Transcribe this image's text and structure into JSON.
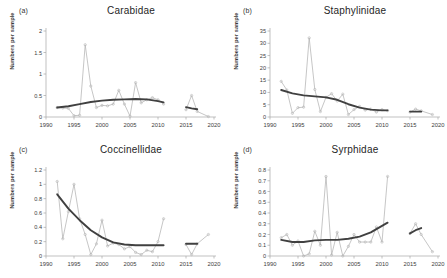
{
  "figure": {
    "background": "#ffffff",
    "series_color": "#b3b3b3",
    "trend_color": "#404040",
    "axis_color": "#a6a6a6",
    "text_color": "#3d3d3d"
  },
  "panels": [
    {
      "letter": "(a)",
      "title": "Carabidae",
      "ylabel": "Numbers per sample"
    },
    {
      "letter": "(b)",
      "title": "Staphylinidae",
      "ylabel": "Numbers per sample"
    },
    {
      "letter": "(c)",
      "title": "Coccinellidae",
      "ylabel": "Numbers per sample"
    },
    {
      "letter": "(d)",
      "title": "Syrphidae",
      "ylabel": "Numbers per sample"
    }
  ],
  "chart_data": [
    {
      "type": "line",
      "panel": "(a)",
      "title": "Carabidae",
      "xlabel": "",
      "ylabel": "Numbers per sample",
      "xlim": [
        1990,
        2020
      ],
      "ylim": [
        0,
        2
      ],
      "xticks": [
        1990,
        1995,
        2000,
        2005,
        2010,
        2015,
        2020
      ],
      "yticks": [
        0,
        0.5,
        1,
        1.5,
        2
      ],
      "grid": false,
      "legend": "none",
      "series": [
        {
          "name": "Numbers per sample (annual means)",
          "color": "#b3b3b3",
          "marker": "open-circle",
          "x": [
            1992,
            1993,
            1994,
            1995,
            1996,
            1997,
            1998,
            1999,
            2000,
            2001,
            2002,
            2003,
            2004,
            2005,
            2006,
            2007,
            2008,
            2009,
            2010,
            2011,
            2015,
            2016,
            2017,
            2019
          ],
          "y": [
            0.22,
            0.21,
            0.2,
            0.03,
            0.04,
            1.68,
            0.72,
            0.22,
            0.27,
            0.26,
            0.3,
            0.62,
            0.3,
            0.02,
            0.8,
            0.33,
            0.4,
            0.45,
            0.4,
            0.3,
            0.17,
            0.5,
            0.13,
            0.01
          ]
        },
        {
          "name": "Smoothed trend",
          "color": "#404040",
          "marker": "none",
          "x": [
            1992,
            1994,
            1996,
            1998,
            2000,
            2002,
            2004,
            2006,
            2008,
            2010,
            2011,
            2015,
            2016,
            2017
          ],
          "y": [
            0.22,
            0.25,
            0.3,
            0.35,
            0.38,
            0.4,
            0.41,
            0.42,
            0.41,
            0.37,
            0.34,
            0.23,
            0.2,
            0.18
          ]
        }
      ]
    },
    {
      "type": "line",
      "panel": "(b)",
      "title": "Staphylinidae",
      "xlabel": "",
      "ylabel": "Numbers per sample",
      "xlim": [
        1990,
        2020
      ],
      "ylim": [
        0,
        35
      ],
      "xticks": [
        1990,
        1995,
        2000,
        2005,
        2010,
        2015,
        2020
      ],
      "yticks": [
        0,
        5,
        10,
        15,
        20,
        25,
        30,
        35
      ],
      "grid": false,
      "legend": "none",
      "series": [
        {
          "name": "Numbers per sample (annual means)",
          "color": "#b3b3b3",
          "marker": "open-circle",
          "x": [
            1992,
            1993,
            1994,
            1995,
            1996,
            1997,
            1998,
            1999,
            2000,
            2001,
            2002,
            2003,
            2004,
            2005,
            2006,
            2007,
            2008,
            2009,
            2010,
            2011,
            2015,
            2016,
            2017,
            2019
          ],
          "y": [
            14.5,
            11.0,
            1.5,
            3.8,
            4.0,
            32.2,
            11.2,
            2.2,
            8.0,
            9.5,
            6.5,
            9.3,
            1.0,
            3.0,
            4.3,
            2.8,
            3.2,
            2.0,
            3.0,
            2.6,
            2.0,
            3.2,
            2.5,
            1.0
          ]
        },
        {
          "name": "Smoothed trend",
          "color": "#404040",
          "marker": "none",
          "x": [
            1992,
            1994,
            1996,
            1998,
            2000,
            2002,
            2004,
            2006,
            2008,
            2010,
            2011,
            2015,
            2016,
            2017
          ],
          "y": [
            11.0,
            9.6,
            8.8,
            8.4,
            8.0,
            7.0,
            5.2,
            3.8,
            3.0,
            2.7,
            2.7,
            2.2,
            2.2,
            2.2
          ]
        }
      ]
    },
    {
      "type": "line",
      "panel": "(c)",
      "title": "Coccinellidae",
      "xlabel": "",
      "ylabel": "Numbers per sample",
      "xlim": [
        1990,
        2020
      ],
      "ylim": [
        0,
        1.2
      ],
      "xticks": [
        1990,
        1995,
        2000,
        2005,
        2010,
        2015,
        2020
      ],
      "yticks": [
        0,
        0.2,
        0.4,
        0.6,
        0.8,
        1,
        1.2
      ],
      "grid": false,
      "legend": "none",
      "series": [
        {
          "name": "Numbers per sample (annual means)",
          "color": "#b3b3b3",
          "marker": "open-circle",
          "x": [
            1992,
            1993,
            1994,
            1995,
            1996,
            1997,
            1998,
            1999,
            2000,
            2001,
            2002,
            2003,
            2004,
            2005,
            2006,
            2007,
            2008,
            2009,
            2010,
            2011,
            2015,
            2016,
            2017,
            2019
          ],
          "y": [
            1.04,
            0.24,
            0.62,
            1.0,
            0.52,
            0.3,
            0.02,
            0.17,
            0.5,
            0.14,
            0.18,
            0.16,
            0.1,
            0.13,
            0.05,
            0.02,
            0.08,
            0.06,
            0.2,
            0.52,
            0.16,
            0.02,
            0.17,
            0.3
          ]
        },
        {
          "name": "Smoothed trend",
          "color": "#404040",
          "marker": "none",
          "x": [
            1992,
            1994,
            1996,
            1998,
            2000,
            2002,
            2004,
            2006,
            2008,
            2010,
            2011,
            2015,
            2016,
            2017
          ],
          "y": [
            0.86,
            0.66,
            0.5,
            0.36,
            0.26,
            0.19,
            0.16,
            0.15,
            0.15,
            0.15,
            0.15,
            0.17,
            0.17,
            0.17
          ]
        }
      ]
    },
    {
      "type": "line",
      "panel": "(d)",
      "title": "Syrphidae",
      "xlabel": "",
      "ylabel": "Numbers per sample",
      "xlim": [
        1990,
        2020
      ],
      "ylim": [
        0,
        0.8
      ],
      "xticks": [
        1990,
        1995,
        2000,
        2005,
        2010,
        2015,
        2020
      ],
      "yticks": [
        0,
        0.1,
        0.2,
        0.3,
        0.4,
        0.5,
        0.6,
        0.7,
        0.8
      ],
      "grid": false,
      "legend": "none",
      "series": [
        {
          "name": "Numbers per sample (annual means)",
          "color": "#b3b3b3",
          "marker": "open-circle",
          "x": [
            1992,
            1993,
            1994,
            1995,
            1996,
            1997,
            1998,
            1999,
            2000,
            2001,
            2002,
            2003,
            2004,
            2005,
            2006,
            2007,
            2008,
            2009,
            2010,
            2011,
            2015,
            2016,
            2017,
            2019
          ],
          "y": [
            0.17,
            0.2,
            0.1,
            0.14,
            0.0,
            0.02,
            0.23,
            0.1,
            0.74,
            0.01,
            0.22,
            0.0,
            0.09,
            0.2,
            0.13,
            0.13,
            0.13,
            0.27,
            0.13,
            0.74,
            0.21,
            0.3,
            0.2,
            0.04
          ]
        },
        {
          "name": "Smoothed trend",
          "color": "#404040",
          "marker": "none",
          "x": [
            1992,
            1994,
            1996,
            1998,
            2000,
            2002,
            2004,
            2006,
            2008,
            2010,
            2011,
            2015,
            2016,
            2017
          ],
          "y": [
            0.15,
            0.13,
            0.13,
            0.145,
            0.15,
            0.15,
            0.16,
            0.18,
            0.22,
            0.28,
            0.31,
            0.21,
            0.24,
            0.26
          ]
        }
      ]
    }
  ]
}
